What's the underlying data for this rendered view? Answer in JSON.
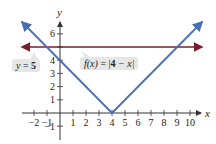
{
  "chart_data": {
    "type": "line",
    "title": "",
    "xlabel": "x",
    "ylabel": "y",
    "xlim": [
      -3,
      11
    ],
    "ylim": [
      -1.5,
      7.2
    ],
    "grid": false,
    "x_ticks": [
      -2,
      -1,
      1,
      2,
      3,
      4,
      5,
      6,
      7,
      8,
      9,
      10
    ],
    "y_ticks": [
      -1,
      1,
      2,
      3,
      4,
      5,
      6
    ],
    "x_tick_labels": [
      "−2",
      "−1",
      "1",
      "2",
      "3",
      "4",
      "5",
      "6",
      "7",
      "8",
      "9",
      "10"
    ],
    "y_tick_labels": [
      "−1",
      "1",
      "2",
      "3",
      "4",
      "6"
    ],
    "series": [
      {
        "name": "f(x) = |4 − x|",
        "color": "#4a6fb0",
        "points": [
          [
            -3,
            7
          ],
          [
            4,
            0
          ],
          [
            11,
            7
          ]
        ]
      },
      {
        "name": "y = 5",
        "color": "#7a1f2e",
        "points": [
          [
            -3,
            5
          ],
          [
            11,
            5
          ]
        ]
      }
    ],
    "annotations": [
      {
        "text": "f(x) = |4 − x|",
        "target_series": "f(x) = |4 − x|"
      },
      {
        "text": "y = 5",
        "target_series": "y = 5"
      }
    ]
  },
  "labels": {
    "x_axis": "x",
    "y_axis": "y",
    "f_label_prefix": "f",
    "f_label_arg": "(x)",
    "f_label_eq": " = |",
    "f_label_four": "4",
    "f_label_rest": " − x|",
    "y5_label_var": "y",
    "y5_label_eq": " = ",
    "y5_label_val": "5"
  },
  "colors": {
    "abs_line": "#4a6fb0",
    "horizontal_line": "#7a1f2e",
    "axis": "#333333",
    "callout_bg": "#e6e6e6"
  }
}
